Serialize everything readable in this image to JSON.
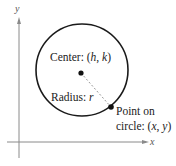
{
  "diagram": {
    "type": "circle-standard-form",
    "colors": {
      "axis": "#8a8a8a",
      "circle": "#1a1a1a",
      "radius_line": "#9a9a9a",
      "point": "#111111",
      "text": "#222222"
    },
    "axes": {
      "x_label": "x",
      "y_label": "y"
    },
    "circle": {
      "center_px": [
        82,
        70
      ],
      "radius_px": 46
    },
    "center": {
      "label_prefix": "Center: (",
      "h": "h",
      "sep": ", ",
      "k": "k",
      "label_suffix": ")"
    },
    "radius": {
      "label_prefix": "Radius: ",
      "symbol": "r"
    },
    "point": {
      "line1": "Point on",
      "line2_prefix": "circle: (",
      "x": "x",
      "sep": ", ",
      "y": "y",
      "line2_suffix": ")"
    }
  }
}
